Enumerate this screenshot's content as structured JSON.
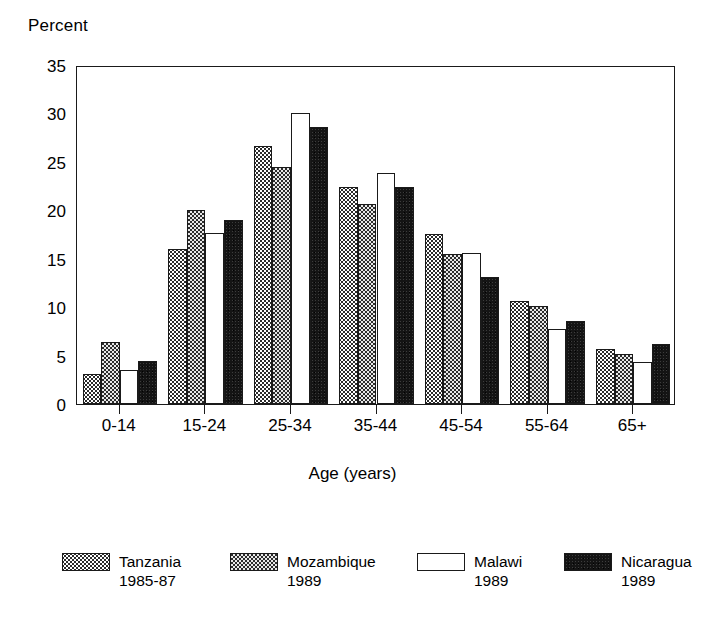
{
  "chart_data": {
    "type": "bar",
    "title": "",
    "xlabel": "Age (years)",
    "ylabel": "Percent",
    "categories": [
      "0-14",
      "15-24",
      "25-34",
      "35-44",
      "45-54",
      "55-64",
      "65+"
    ],
    "series": [
      {
        "name": "Tanzania",
        "year": "1985-87",
        "pattern": "light-stipple",
        "values": [
          3.1,
          16.0,
          26.6,
          22.4,
          17.6,
          10.6,
          5.7
        ]
      },
      {
        "name": "Mozambique",
        "year": "1989",
        "pattern": "dark-checker",
        "values": [
          6.4,
          20.0,
          24.5,
          20.6,
          15.5,
          10.1,
          5.2
        ]
      },
      {
        "name": "Malawi",
        "year": "1989",
        "pattern": "white-unfilled",
        "values": [
          3.5,
          17.7,
          30.0,
          23.9,
          15.6,
          7.7,
          4.3
        ]
      },
      {
        "name": "Nicaragua",
        "year": "1989",
        "pattern": "solid-black",
        "values": [
          4.4,
          19.0,
          28.6,
          22.4,
          13.1,
          8.6,
          6.2
        ]
      }
    ],
    "ylim": [
      0,
      35
    ],
    "yticks": [
      0,
      5,
      10,
      15,
      20,
      25,
      30,
      35
    ],
    "ytick_labels": [
      "0",
      "5",
      "10",
      "15",
      "20",
      "25",
      "30",
      "35"
    ],
    "grid": false,
    "legend_position": "bottom",
    "axis_color": "#1a1a1a"
  },
  "legend": {
    "items": [
      {
        "name": "Tanzania",
        "year": "1985-87"
      },
      {
        "name": "Mozambique",
        "year": "1989"
      },
      {
        "name": "Malawi",
        "year": "1989"
      },
      {
        "name": "Nicaragua",
        "year": "1989"
      }
    ]
  }
}
